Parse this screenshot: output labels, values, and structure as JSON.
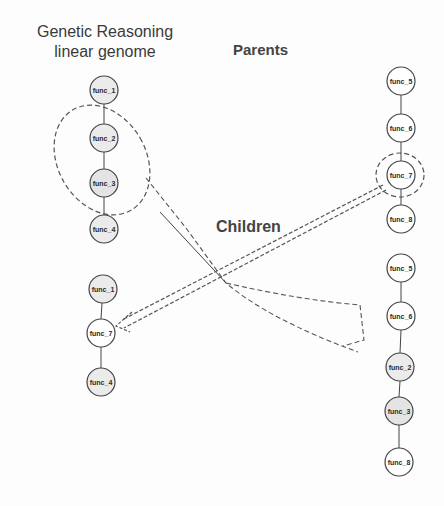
{
  "titles": {
    "main_line1": "Genetic Reasoning",
    "main_line2": "linear genome",
    "parents": "Parents",
    "children": "Children"
  },
  "colors": {
    "stroke": "#555555",
    "shaded_fill": "#e6e6e6",
    "white_fill": "#ffffff"
  },
  "parent_left": [
    "func_1",
    "func_2",
    "func_3",
    "func_4"
  ],
  "parent_right": [
    "func_5",
    "func_6",
    "func_7",
    "func_8"
  ],
  "child_left": [
    "func_1",
    "func_7",
    "func_4"
  ],
  "child_right": [
    "func_5",
    "func_6",
    "func_2",
    "func_3",
    "func_8"
  ]
}
